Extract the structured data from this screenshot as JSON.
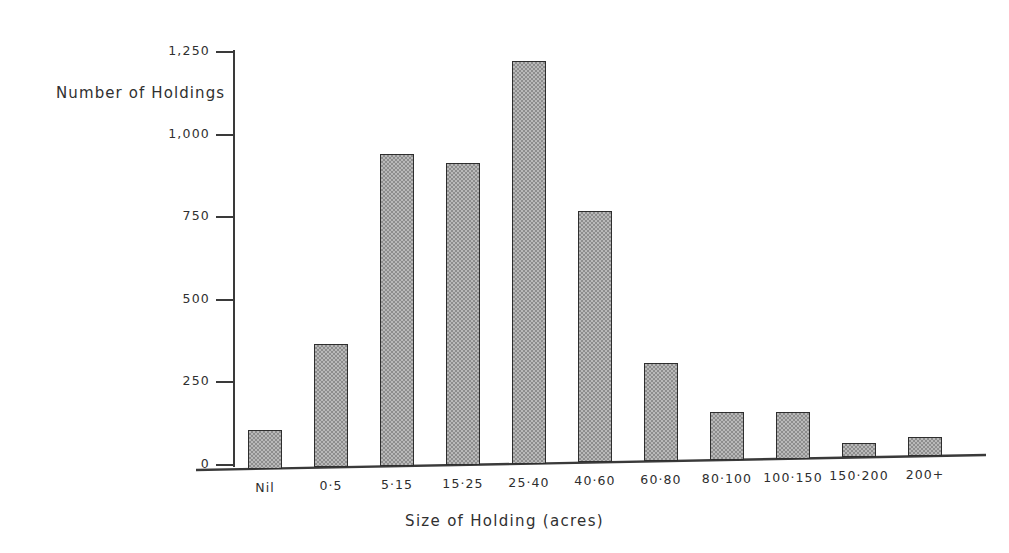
{
  "chart_data": {
    "type": "bar",
    "title": "",
    "xlabel": "Size of Holding (acres)",
    "ylabel": "Number of Holdings",
    "categories": [
      "Nil",
      "0·5",
      "5·15",
      "15·25",
      "25·40",
      "40·60",
      "60·80",
      "80·100",
      "100·150",
      "150·200",
      "200+"
    ],
    "values": [
      118,
      375,
      945,
      915,
      1220,
      762,
      297,
      146,
      140,
      45,
      57
    ],
    "ylim": [
      0,
      1250
    ],
    "xlim_note": "categorical",
    "yticks": [
      0,
      250,
      500,
      750,
      1000,
      1250
    ],
    "ytick_labels": [
      "0",
      "250",
      "500",
      "750",
      "1,000",
      "1,250"
    ],
    "grid": false,
    "legend": "none",
    "series_name": "Number of Holdings",
    "bar_fill": "#b9b9b9",
    "bar_pattern": "checkerboard-dither",
    "bar_outline": "#2e2e2e",
    "axis_color": "#3a3a3a",
    "background": "#ffffff"
  }
}
